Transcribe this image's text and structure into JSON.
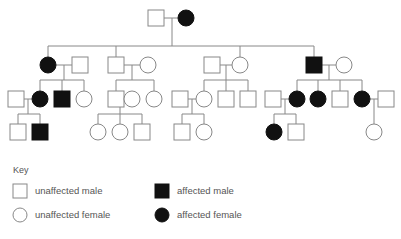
{
  "diagram": {
    "type": "pedigree-chart",
    "line_color": "#888888",
    "affected_fill": "#111111",
    "unaffected_fill": "#ffffff",
    "generations": [
      {
        "gen": "I",
        "members": [
          "unaffected male",
          "affected female"
        ]
      },
      {
        "gen": "II",
        "members": [
          "affected female",
          "unaffected male (spouse)",
          "unaffected male",
          "unaffected female (spouse)",
          "unaffected male (spouse)",
          "unaffected female",
          "affected male",
          "unaffected female (spouse)"
        ]
      },
      {
        "gen": "III",
        "members": [
          "unaffected male (spouse)",
          "affected female",
          "affected male",
          "unaffected female",
          "unaffected male",
          "unaffected female (spouse)",
          "unaffected female",
          "unaffected male (spouse)",
          "unaffected female",
          "unaffected male",
          "unaffected male",
          "unaffected male (spouse)",
          "affected female",
          "affected female",
          "unaffected male",
          "affected female",
          "unaffected male (spouse)"
        ]
      },
      {
        "gen": "IV",
        "members": [
          "unaffected male",
          "affected male",
          "unaffected female",
          "unaffected female",
          "unaffected male",
          "unaffected male",
          "unaffected female",
          "affected female",
          "unaffected male",
          "unaffected female"
        ]
      }
    ]
  },
  "key": {
    "title": "Key",
    "items": [
      {
        "symbol": "square-empty",
        "label": "unaffected male"
      },
      {
        "symbol": "square-filled",
        "label": "affected male"
      },
      {
        "symbol": "circle-empty",
        "label": "unaffected female"
      },
      {
        "symbol": "circle-filled",
        "label": "affected female"
      }
    ]
  }
}
